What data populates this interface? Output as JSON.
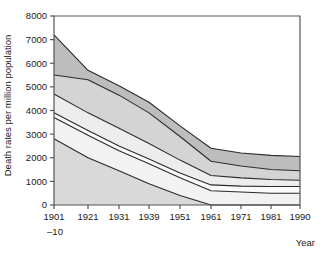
{
  "chart_data": {
    "type": "area",
    "title": "",
    "subtitle": "",
    "xlabel": "Year",
    "ylabel": "Death rates per million population",
    "grid": false,
    "legend": "none",
    "stacked": true,
    "categories": [
      "1901–10",
      "1921",
      "1931",
      "1939",
      "1951",
      "1961",
      "1971",
      "1981",
      "1990"
    ],
    "x_tick_labels": [
      "1901",
      "1921",
      "1931",
      "1939",
      "1951",
      "1961",
      "1971",
      "1981",
      "1990"
    ],
    "x_tick_sublabel": "–10",
    "y_tick_labels": [
      "0",
      "1000",
      "2000",
      "3000",
      "4000",
      "5000",
      "6000",
      "7000",
      "8000"
    ],
    "y_tick_values": [
      0,
      1000,
      2000,
      3000,
      4000,
      5000,
      6000,
      7000,
      8000
    ],
    "ylim": [
      0,
      8000
    ],
    "cumulative_boundaries": [
      {
        "name": "band-1-top",
        "values": [
          2800,
          2000,
          1450,
          900,
          400,
          0,
          0,
          0,
          0
        ]
      },
      {
        "name": "band-2-top",
        "values": [
          3700,
          2950,
          2300,
          1750,
          1150,
          600,
          550,
          500,
          500
        ]
      },
      {
        "name": "band-3-top",
        "values": [
          3900,
          3150,
          2500,
          1950,
          1350,
          850,
          800,
          780,
          780
        ]
      },
      {
        "name": "band-4-top",
        "values": [
          4700,
          3900,
          3250,
          2600,
          1900,
          1250,
          1150,
          1080,
          1050
        ]
      },
      {
        "name": "band-5-top",
        "values": [
          5500,
          5300,
          4650,
          3900,
          2900,
          1850,
          1650,
          1500,
          1450
        ]
      },
      {
        "name": "band-6-top",
        "values": [
          7200,
          5700,
          5050,
          4350,
          3350,
          2400,
          2200,
          2100,
          2050
        ]
      }
    ],
    "series": [
      {
        "name": "series-1",
        "color": "#d9d9d9",
        "values": [
          2800,
          2000,
          1450,
          900,
          400,
          0,
          0,
          0,
          0
        ]
      },
      {
        "name": "series-2",
        "color": "#f2f2f2",
        "values": [
          900,
          950,
          850,
          850,
          750,
          600,
          550,
          500,
          500
        ]
      },
      {
        "name": "series-3",
        "color": "#fafafa",
        "values": [
          200,
          200,
          200,
          200,
          200,
          250,
          250,
          280,
          280
        ]
      },
      {
        "name": "series-4",
        "color": "#ededed",
        "values": [
          800,
          750,
          750,
          650,
          550,
          400,
          350,
          300,
          270
        ]
      },
      {
        "name": "series-5",
        "color": "#d4d4d4",
        "values": [
          800,
          1400,
          1400,
          1300,
          1000,
          600,
          500,
          420,
          400
        ]
      },
      {
        "name": "series-6",
        "color": "#bdbdbd",
        "values": [
          1700,
          400,
          400,
          450,
          450,
          550,
          550,
          600,
          600
        ]
      }
    ],
    "axis_color": "#555555",
    "line_color": "#2b2b2b"
  },
  "plot": {
    "left_px": 54,
    "right_px": 300,
    "top_px": 16,
    "bottom_px": 205
  }
}
